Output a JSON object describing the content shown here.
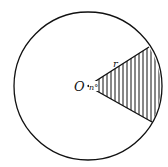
{
  "diagram": {
    "type": "circle-sector",
    "center_label": "O",
    "radius_label": "r",
    "angle_label": "n°",
    "hatched_region": "sector",
    "colors": {
      "stroke": "#111111",
      "background": "#ffffff"
    }
  }
}
